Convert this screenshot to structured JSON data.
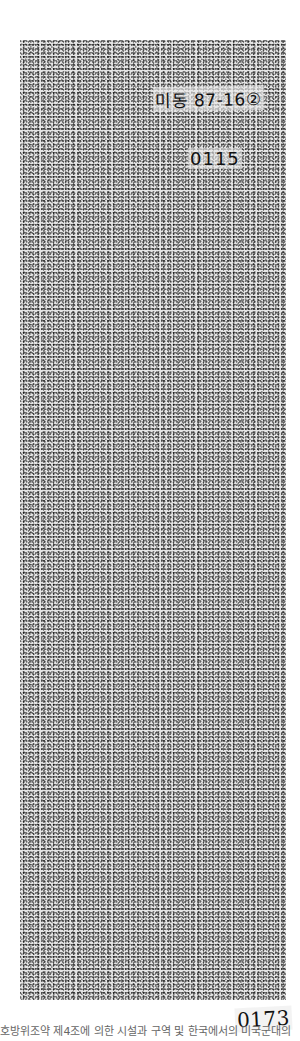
{
  "document": {
    "handwritten_reference": "미동 87-16②",
    "page_number_top": "0115",
    "page_number_bottom": "0173"
  },
  "caption": {
    "text": "호방위조약 제4조에 의한 시설과 구역 및 한국에서의 미국군대의"
  },
  "colors": {
    "page_background": "#ffffff",
    "scan_tone": "#e4e4e4",
    "ink": "#111111",
    "caption_text": "#666666"
  }
}
